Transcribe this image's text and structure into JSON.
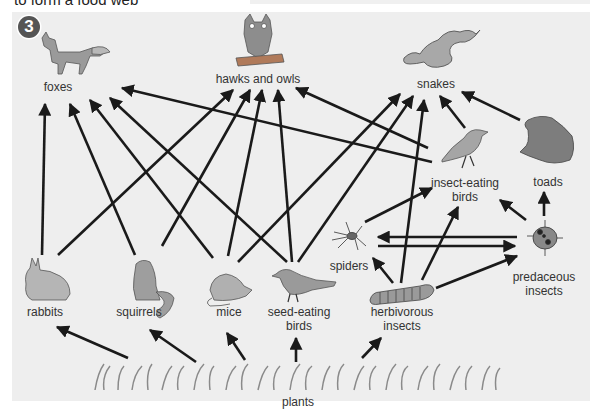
{
  "header": {
    "cut_off_text": "to form a food web",
    "badge_number": "3"
  },
  "diagram": {
    "type": "food web",
    "arrow_meaning": "arrow points from food source to consumer",
    "nodes": {
      "foxes": {
        "label": "foxes",
        "x": 58,
        "y": 86
      },
      "hawks_and_owls": {
        "label": "hawks and owls",
        "x": 258,
        "y": 80
      },
      "snakes": {
        "label": "snakes",
        "x": 436,
        "y": 84
      },
      "insect_eating_birds": {
        "label": "insect-eating\nbirds",
        "line1": "insect-eating",
        "line2": "birds",
        "x": 465,
        "y": 183
      },
      "toads": {
        "label": "toads",
        "x": 548,
        "y": 181
      },
      "spiders": {
        "label": "spiders",
        "x": 349,
        "y": 264
      },
      "predaceous_insects": {
        "label": "predaceous\ninsects",
        "line1": "predaceous",
        "line2": "insects",
        "x": 544,
        "y": 278
      },
      "rabbits": {
        "label": "rabbits",
        "x": 45,
        "y": 311
      },
      "squirrels": {
        "label": "squirrels",
        "x": 139,
        "y": 311
      },
      "mice": {
        "label": "mice",
        "x": 229,
        "y": 311
      },
      "seed_eating_birds": {
        "label": "seed-eating\nbirds",
        "line1": "seed-eating",
        "line2": "birds",
        "x": 299,
        "y": 311
      },
      "herbivorous_insects": {
        "label": "herbivorous\ninsects",
        "line1": "herbivorous",
        "line2": "insects",
        "x": 402,
        "y": 311
      },
      "plants": {
        "label": "plants",
        "x": 298,
        "y": 400
      }
    },
    "edges": [
      {
        "from": "rabbits",
        "to": "foxes"
      },
      {
        "from": "rabbits",
        "to": "hawks_and_owls"
      },
      {
        "from": "squirrels",
        "to": "foxes"
      },
      {
        "from": "squirrels",
        "to": "hawks_and_owls"
      },
      {
        "from": "mice",
        "to": "foxes"
      },
      {
        "from": "mice",
        "to": "hawks_and_owls"
      },
      {
        "from": "mice",
        "to": "snakes"
      },
      {
        "from": "seed_eating_birds",
        "to": "foxes"
      },
      {
        "from": "seed_eating_birds",
        "to": "hawks_and_owls"
      },
      {
        "from": "seed_eating_birds",
        "to": "snakes"
      },
      {
        "from": "insect_eating_birds",
        "to": "foxes"
      },
      {
        "from": "insect_eating_birds",
        "to": "hawks_and_owls"
      },
      {
        "from": "insect_eating_birds",
        "to": "snakes"
      },
      {
        "from": "toads",
        "to": "snakes"
      },
      {
        "from": "spiders",
        "to": "insect_eating_birds"
      },
      {
        "from": "spiders",
        "to": "predaceous_insects"
      },
      {
        "from": "herbivorous_insects",
        "to": "spiders"
      },
      {
        "from": "herbivorous_insects",
        "to": "snakes"
      },
      {
        "from": "herbivorous_insects",
        "to": "insect_eating_birds"
      },
      {
        "from": "herbivorous_insects",
        "to": "predaceous_insects"
      },
      {
        "from": "predaceous_insects",
        "to": "spiders"
      },
      {
        "from": "predaceous_insects",
        "to": "insect_eating_birds"
      },
      {
        "from": "predaceous_insects",
        "to": "toads"
      },
      {
        "from": "plants",
        "to": "rabbits"
      },
      {
        "from": "plants",
        "to": "squirrels"
      },
      {
        "from": "plants",
        "to": "mice"
      },
      {
        "from": "plants",
        "to": "seed_eating_birds"
      },
      {
        "from": "plants",
        "to": "herbivorous_insects"
      }
    ]
  },
  "colors": {
    "panel_bg": "#eeeeee",
    "arrow": "#1a1a1a",
    "label_text": "#333333",
    "animal_fill": "#9a9a9a",
    "badge_bg": "#555555"
  }
}
